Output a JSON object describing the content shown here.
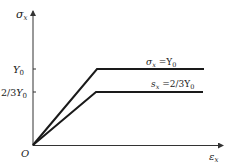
{
  "diagram": {
    "type": "stress-strain-line-diagram",
    "y_axis": {
      "label": "σ",
      "label_sub": "x"
    },
    "x_axis": {
      "label": "ε",
      "label_sub": "x"
    },
    "origin_label": "O",
    "y_ticks": [
      {
        "label": "Y",
        "sub": "0",
        "prefix": ""
      },
      {
        "label": "Y",
        "sub": "0",
        "prefix": "2/3"
      }
    ],
    "curves": [
      {
        "name": "upper",
        "annotation_lhs": "σ",
        "annotation_sub": "x",
        "annotation_rhs": " =Y",
        "annotation_rhs_sub": "0",
        "yield_level": "Y0"
      },
      {
        "name": "lower",
        "annotation_lhs": "s",
        "annotation_sub": "x",
        "annotation_rhs": " =2/3Y",
        "annotation_rhs_sub": "0",
        "yield_level": "2/3Y0"
      }
    ],
    "colors": {
      "line": "#1a1a1a",
      "axis": "#333333",
      "text": "#222222"
    }
  }
}
